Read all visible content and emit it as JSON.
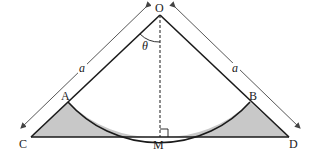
{
  "diagram": {
    "title": "",
    "points": {
      "O": "O",
      "A": "A",
      "B": "B",
      "C": "C",
      "D": "D",
      "M": "M"
    },
    "angle_label": "θ",
    "side_label_left": "a",
    "side_label_right": "a",
    "colors": {
      "line": "#1a1a1a",
      "shade": "#c8c8c8",
      "arrow": "#444444",
      "background": "#ffffff"
    },
    "elements": [
      "triangle OCD",
      "arc AB centered at O tangent to CD at M",
      "dashed altitude OM with right-angle mark",
      "shaded regions between arc and sides CA, BD",
      "dimension arrows labeled a along OC and OD"
    ]
  }
}
